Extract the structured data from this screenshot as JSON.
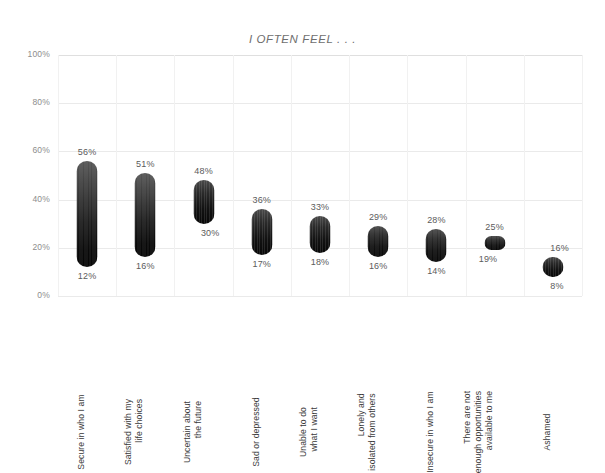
{
  "chart_data": {
    "type": "bar",
    "title": "I OFTEN FEEL . . .",
    "xlabel": "",
    "ylabel": "",
    "ylim": [
      0,
      100
    ],
    "grid": true,
    "legend": false,
    "y_ticks": [
      "0%",
      "20%",
      "40%",
      "60%",
      "80%",
      "100%"
    ],
    "y_tick_values": [
      0,
      20,
      40,
      60,
      80,
      100
    ],
    "bar_style": "floating range bars (rounded caps, dark gradient)",
    "categories": [
      "Secure in who I am",
      "Satisfied with my life choices",
      "Uncertain about the future",
      "Sad or depressed",
      "Unable to do what I want",
      "Lonely and isolated from others",
      "Insecure in who I am",
      "There are not enough opportunities available to me",
      "Ashamed"
    ],
    "series": [
      {
        "name": "High",
        "values": [
          56,
          51,
          48,
          36,
          33,
          29,
          28,
          25,
          16
        ]
      },
      {
        "name": "Low",
        "values": [
          12,
          16,
          30,
          17,
          18,
          16,
          14,
          19,
          8
        ]
      }
    ],
    "high_labels": [
      "56%",
      "51%",
      "48%",
      "36%",
      "33%",
      "29%",
      "28%",
      "25%",
      "16%"
    ],
    "low_labels": [
      "12%",
      "16%",
      "30%",
      "17%",
      "18%",
      "16%",
      "14%",
      "19%",
      "8%"
    ]
  },
  "x_axis_label_lines": [
    [
      "Secure in who I am"
    ],
    [
      "Satisfied with my",
      "life choices"
    ],
    [
      "Uncertain about",
      "the future"
    ],
    [
      "Sad or depressed"
    ],
    [
      "Unable to do",
      "what I want"
    ],
    [
      "Lonely and",
      "isolated from others"
    ],
    [
      "Insecure in who I am"
    ],
    [
      "There are not",
      "enough opportunities",
      "available to me"
    ],
    [
      "Ashamed"
    ]
  ]
}
